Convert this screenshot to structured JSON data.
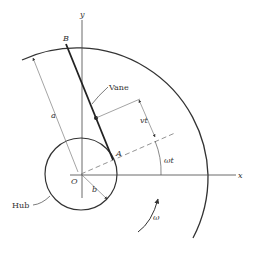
{
  "diagram": {
    "type": "rotating-vane-kinematics",
    "labels": {
      "y_axis": "y",
      "x_axis": "x",
      "point_B": "B",
      "point_A": "A",
      "origin": "O",
      "vane": "Vane",
      "hub": "Hub",
      "length_a": "a",
      "radius_b": "b",
      "slide_dist": "vt",
      "angle": "ωt",
      "angular_velocity": "ω"
    },
    "colors": {
      "line": "#333333",
      "thin_line": "#555555",
      "dashed": "#888888"
    }
  }
}
